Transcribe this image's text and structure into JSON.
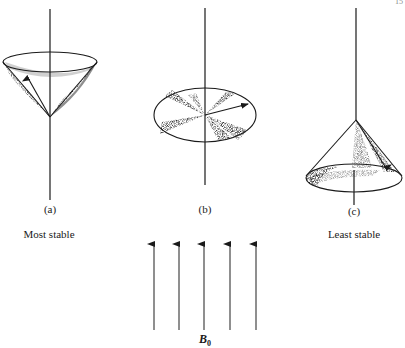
{
  "page": {
    "number": "15"
  },
  "figure": {
    "panels": [
      {
        "id": "a",
        "label": "(a)",
        "caption": "Most stable",
        "description": "cone opening upward, vector precessing along the upper cone"
      },
      {
        "id": "b",
        "label": "(b)",
        "caption": "",
        "description": "flat disc, vector precessing in the horizontal plane"
      },
      {
        "id": "c",
        "label": "(c)",
        "caption": "Least stable",
        "description": "cone opening downward, vector precessing along the lower cone"
      }
    ],
    "field": {
      "label": "B",
      "subscript": "0",
      "arrow_count": 5
    },
    "colors": {
      "ink": "#1a1a1a",
      "background": "#ffffff"
    }
  }
}
